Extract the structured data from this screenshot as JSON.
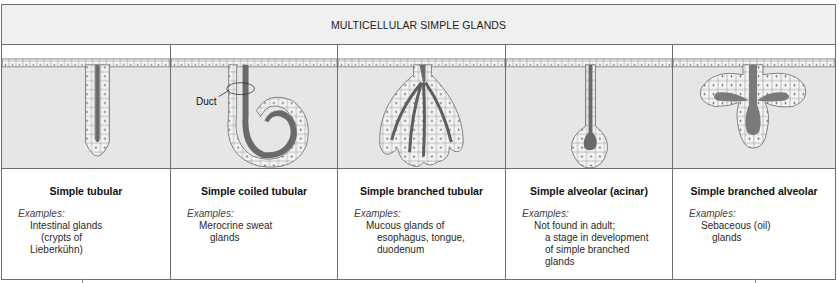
{
  "header": {
    "title": "MULTICELLULAR SIMPLE GLANDS"
  },
  "colors": {
    "border": "#6e6e6e",
    "tissue": "#e6e6e6",
    "header_bg": "#f0f0f0",
    "lumen": "#7a7a7a"
  },
  "glands": [
    {
      "name": "Simple tubular",
      "examples_label": "Examples:",
      "examples": [
        "Intestinal glands",
        "(crypts of",
        "Lieberkühn)"
      ],
      "example_indent": [
        1,
        2,
        1
      ]
    },
    {
      "name": "Simple coiled tubular",
      "examples_label": "Examples:",
      "examples": [
        "Merocrine sweat",
        "glands"
      ],
      "example_indent": [
        1,
        2
      ],
      "annotation": "Duct"
    },
    {
      "name": "Simple branched tubular",
      "examples_label": "Examples:",
      "examples": [
        "Mucous glands of",
        "esophagus, tongue,",
        "duodenum"
      ],
      "example_indent": [
        1,
        2,
        2
      ]
    },
    {
      "name": "Simple alveolar (acinar)",
      "examples_label": "Examples:",
      "examples": [
        "Not found in adult;",
        "a stage in development",
        "of simple branched",
        "glands"
      ],
      "example_indent": [
        1,
        2,
        2,
        2
      ]
    },
    {
      "name": "Simple branched alveolar",
      "examples_label": "Examples:",
      "examples": [
        "Sebaceous (oil)",
        "glands"
      ],
      "example_indent": [
        1,
        2
      ]
    }
  ]
}
